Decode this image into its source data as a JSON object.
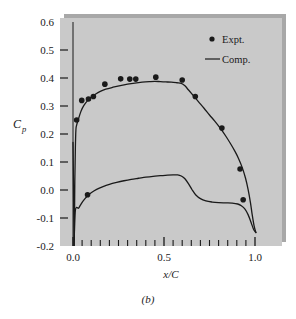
{
  "figure": {
    "caption": "(b)",
    "panel_bg": "#c9c9c9",
    "shadow_color": "#a8a8a8",
    "ink": "#1a1a1a"
  },
  "chart_data": {
    "type": "line",
    "title": "",
    "subtitle": "",
    "xlabel": "x/C",
    "ylabel": "C_p",
    "ylabel_base": "C",
    "ylabel_sub": "p",
    "xlim": [
      -0.03,
      1.06
    ],
    "ylim": [
      -0.2,
      0.6
    ],
    "grid": false,
    "legend_position": "top-right",
    "x_ticks_major": [
      0.0,
      0.5,
      1.0
    ],
    "x_tick_labels": [
      "0.0",
      "0.5",
      "1.0"
    ],
    "x_ticks_minor": [
      0.1,
      0.2,
      0.3,
      0.4,
      0.6,
      0.7,
      0.8,
      0.9
    ],
    "y_ticks": [
      -0.2,
      -0.1,
      0.0,
      0.1,
      0.2,
      0.3,
      0.4,
      0.5,
      0.6
    ],
    "y_tick_labels": [
      "-0.2",
      "-0.1",
      "0.0",
      "0.1",
      "0.2",
      "0.3",
      "0.4",
      "0.5",
      "0.6"
    ],
    "legend": [
      {
        "name": "Expt.",
        "marker": "circle",
        "style": "points"
      },
      {
        "name": "Comp.",
        "marker": "line",
        "style": "line"
      }
    ],
    "series": [
      {
        "name": "Comp. upper surface",
        "style": "line",
        "points": [
          [
            0.0,
            0.17
          ],
          [
            0.002,
            0.06
          ],
          [
            0.004,
            -0.08
          ],
          [
            0.006,
            -0.2
          ],
          [
            0.008,
            -0.12
          ],
          [
            0.01,
            0.03
          ],
          [
            0.013,
            0.15
          ],
          [
            0.016,
            0.215
          ],
          [
            0.02,
            0.232
          ],
          [
            0.026,
            0.245
          ],
          [
            0.034,
            0.262
          ],
          [
            0.045,
            0.283
          ],
          [
            0.06,
            0.302
          ],
          [
            0.08,
            0.319
          ],
          [
            0.1,
            0.331
          ],
          [
            0.125,
            0.343
          ],
          [
            0.15,
            0.352
          ],
          [
            0.18,
            0.36
          ],
          [
            0.22,
            0.367
          ],
          [
            0.26,
            0.373
          ],
          [
            0.3,
            0.378
          ],
          [
            0.34,
            0.382
          ],
          [
            0.38,
            0.385
          ],
          [
            0.42,
            0.387
          ],
          [
            0.45,
            0.388
          ],
          [
            0.48,
            0.387
          ],
          [
            0.51,
            0.386
          ],
          [
            0.54,
            0.385
          ],
          [
            0.57,
            0.383
          ],
          [
            0.595,
            0.381
          ],
          [
            0.615,
            0.372
          ],
          [
            0.635,
            0.357
          ],
          [
            0.66,
            0.338
          ],
          [
            0.69,
            0.315
          ],
          [
            0.72,
            0.292
          ],
          [
            0.75,
            0.268
          ],
          [
            0.78,
            0.245
          ],
          [
            0.81,
            0.22
          ],
          [
            0.84,
            0.192
          ],
          [
            0.865,
            0.166
          ],
          [
            0.89,
            0.138
          ],
          [
            0.91,
            0.112
          ],
          [
            0.93,
            0.08
          ],
          [
            0.948,
            0.042
          ],
          [
            0.962,
            0.002
          ],
          [
            0.975,
            -0.045
          ],
          [
            0.985,
            -0.09
          ],
          [
            0.995,
            -0.128
          ],
          [
            1.005,
            -0.152
          ]
        ]
      },
      {
        "name": "Comp. lower surface",
        "style": "line",
        "points": [
          [
            0.006,
            -0.2
          ],
          [
            0.009,
            -0.12
          ],
          [
            0.013,
            -0.072
          ],
          [
            0.02,
            -0.062
          ],
          [
            0.03,
            -0.065
          ],
          [
            0.04,
            -0.055
          ],
          [
            0.055,
            -0.04
          ],
          [
            0.075,
            -0.024
          ],
          [
            0.1,
            -0.01
          ],
          [
            0.13,
            0.002
          ],
          [
            0.165,
            0.012
          ],
          [
            0.2,
            0.02
          ],
          [
            0.24,
            0.027
          ],
          [
            0.28,
            0.033
          ],
          [
            0.32,
            0.038
          ],
          [
            0.36,
            0.042
          ],
          [
            0.4,
            0.046
          ],
          [
            0.44,
            0.049
          ],
          [
            0.48,
            0.051
          ],
          [
            0.52,
            0.053
          ],
          [
            0.55,
            0.054
          ],
          [
            0.575,
            0.054
          ],
          [
            0.595,
            0.05
          ],
          [
            0.615,
            0.04
          ],
          [
            0.635,
            0.022
          ],
          [
            0.655,
            0.0
          ],
          [
            0.675,
            -0.018
          ],
          [
            0.7,
            -0.031
          ],
          [
            0.73,
            -0.039
          ],
          [
            0.765,
            -0.043
          ],
          [
            0.8,
            -0.045
          ],
          [
            0.84,
            -0.046
          ],
          [
            0.875,
            -0.047
          ],
          [
            0.905,
            -0.05
          ],
          [
            0.925,
            -0.056
          ],
          [
            0.945,
            -0.068
          ],
          [
            0.962,
            -0.088
          ],
          [
            0.978,
            -0.115
          ],
          [
            0.992,
            -0.14
          ],
          [
            1.005,
            -0.152
          ]
        ]
      },
      {
        "name": "Expt.",
        "style": "points",
        "points": [
          [
            0.02,
            0.25
          ],
          [
            0.048,
            0.32
          ],
          [
            0.085,
            0.325
          ],
          [
            0.112,
            0.334
          ],
          [
            0.175,
            0.378
          ],
          [
            0.262,
            0.397
          ],
          [
            0.312,
            0.396
          ],
          [
            0.345,
            0.396
          ],
          [
            0.455,
            0.403
          ],
          [
            0.6,
            0.393
          ],
          [
            0.672,
            0.334
          ],
          [
            0.818,
            0.221
          ],
          [
            0.918,
            0.075
          ],
          [
            0.935,
            -0.035
          ],
          [
            0.08,
            -0.017
          ]
        ]
      }
    ]
  },
  "axes": {
    "y_axis_label_text": "Cp",
    "x_axis_label_text": "x/C"
  }
}
